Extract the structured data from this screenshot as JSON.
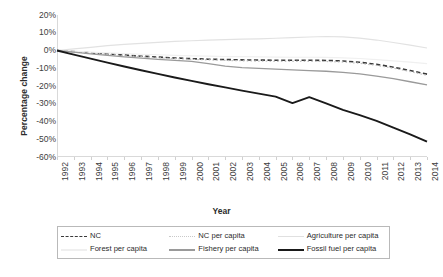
{
  "chart_data": {
    "type": "line",
    "title": "",
    "xlabel": "Year",
    "ylabel": "Percentage change",
    "grid": false,
    "legend_position": "bottom",
    "x": [
      1992,
      1993,
      1994,
      1995,
      1996,
      1997,
      1998,
      1999,
      2000,
      2001,
      2002,
      2003,
      2004,
      2005,
      2006,
      2007,
      2008,
      2009,
      2010,
      2011,
      2012,
      2013,
      2014
    ],
    "xlim": [
      1992,
      2014
    ],
    "ylim": [
      -60,
      20
    ],
    "ytick_values": [
      20,
      10,
      0,
      -10,
      -20,
      -30,
      -40,
      -50,
      -60
    ],
    "ytick_labels": [
      "20%",
      "10%",
      "0%",
      "-10%",
      "-20%",
      "-30%",
      "-40%",
      "-50%",
      "-60%"
    ],
    "xtick_labels": [
      "1992",
      "1993",
      "1994",
      "1995",
      "1996",
      "1997",
      "1998",
      "1999",
      "2000",
      "2001",
      "2002",
      "2003",
      "2004",
      "2005",
      "2006",
      "2007",
      "2008",
      "2009",
      "2010",
      "2011",
      "2012",
      "2013",
      "2014"
    ],
    "series": [
      {
        "name": "NC",
        "style": "dashed",
        "color": "#3a3a3a",
        "width": 1.6,
        "values": [
          0,
          -0.6,
          -1.3,
          -1.9,
          -2.6,
          -3.2,
          -3.7,
          -4.2,
          -4.6,
          -4.9,
          -5.1,
          -5.3,
          -5.4,
          -5.5,
          -5.5,
          -5.5,
          -5.6,
          -5.9,
          -6.6,
          -7.8,
          -9.4,
          -11.3,
          -13.3
        ]
      },
      {
        "name": "NC per capita",
        "style": "dotted",
        "color": "#c4c4c4",
        "width": 1.2,
        "values": [
          0,
          -0.7,
          -1.5,
          -2.2,
          -2.9,
          -3.5,
          -4.1,
          -4.6,
          -5.0,
          -5.3,
          -5.6,
          -5.8,
          -6.0,
          -6.1,
          -6.1,
          -6.1,
          -6.2,
          -6.5,
          -7.2,
          -8.4,
          -10.0,
          -11.9,
          -14.0
        ]
      },
      {
        "name": "Agriculture per capita",
        "style": "solid",
        "color": "#e2e2e2",
        "width": 1.2,
        "values": [
          0,
          0.9,
          1.8,
          2.7,
          3.4,
          4.0,
          4.6,
          5.1,
          5.5,
          5.8,
          6.1,
          6.4,
          6.6,
          6.9,
          7.2,
          7.6,
          7.9,
          7.7,
          7.0,
          5.9,
          4.5,
          3.0,
          1.4
        ]
      },
      {
        "name": "Forest per capita",
        "style": "solid",
        "color": "#f0f0f0",
        "width": 1.2,
        "values": [
          0,
          -0.4,
          -0.9,
          -1.3,
          -1.7,
          -2.1,
          -2.4,
          -2.7,
          -3.0,
          -3.2,
          -3.4,
          -3.5,
          -3.6,
          -3.7,
          -3.8,
          -3.8,
          -3.9,
          -4.1,
          -4.5,
          -5.1,
          -5.8,
          -6.6,
          -7.4
        ]
      },
      {
        "name": "Fishery per capita",
        "style": "solid",
        "color": "#9a9a9a",
        "width": 1.3,
        "values": [
          0,
          -0.9,
          -1.9,
          -2.8,
          -3.6,
          -4.3,
          -5.0,
          -5.6,
          -6.1,
          -7.4,
          -8.8,
          -9.6,
          -10.1,
          -10.5,
          -10.9,
          -11.3,
          -11.7,
          -12.3,
          -13.2,
          -14.4,
          -15.9,
          -17.6,
          -19.4
        ]
      },
      {
        "name": "Fossil fuel per capita",
        "style": "solid",
        "color": "#1a1a1a",
        "width": 1.9,
        "values": [
          0,
          -2.3,
          -4.6,
          -6.8,
          -9.0,
          -11.1,
          -13.2,
          -15.2,
          -17.1,
          -19.0,
          -20.8,
          -22.6,
          -24.3,
          -26.0,
          -29.6,
          -26.3,
          -29.8,
          -33.5,
          -36.4,
          -39.6,
          -43.4,
          -47.2,
          -51.4
        ]
      }
    ]
  },
  "legend": {
    "items": [
      {
        "label": "NC",
        "style": "dashed",
        "color": "#3a3a3a"
      },
      {
        "label": "NC per capita",
        "style": "dotted",
        "color": "#c9c9c9"
      },
      {
        "label": "Agriculture per capita",
        "style": "solid",
        "color": "#e0e0e0"
      },
      {
        "label": "Forest per capita",
        "style": "solid",
        "color": "#efefef"
      },
      {
        "label": "Fishery per capita",
        "style": "solid",
        "color": "#9a9a9a"
      },
      {
        "label": "Fossil fuel per capita",
        "style": "solid",
        "color": "#1a1a1a"
      }
    ]
  }
}
